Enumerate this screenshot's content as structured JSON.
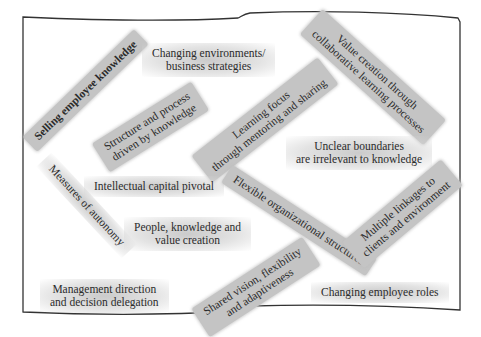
{
  "diagram": {
    "type": "concept-collage",
    "frame": "waving-flag-outline",
    "concepts": [
      {
        "id": "selling-knowledge",
        "text": "Selling employee knowledge",
        "lines": [
          "Selling employee knowledge"
        ],
        "style": "ribbon"
      },
      {
        "id": "changing-env",
        "text": "Changing environments/ business strategies",
        "lines": [
          "Changing environments/",
          "business strategies"
        ],
        "style": "soft"
      },
      {
        "id": "value-creation",
        "text": "Value creation through collaborative learning processes",
        "lines": [
          "Value creation through",
          "collaborative learning processes"
        ],
        "style": "ribbon"
      },
      {
        "id": "structure-process",
        "text": "Structure and process driven by knowledge",
        "lines": [
          "Structure and process",
          "driven by knowledge"
        ],
        "style": "ribbon"
      },
      {
        "id": "learning-focus",
        "text": "Learning focus through mentoring and sharing",
        "lines": [
          "Learning focus",
          "through mentoring and sharing"
        ],
        "style": "ribbon"
      },
      {
        "id": "unclear-boundaries",
        "text": "Unclear boundaries are irrelevant to knowledge",
        "lines": [
          "Unclear boundaries",
          "are irrelevant to knowledge"
        ],
        "style": "soft"
      },
      {
        "id": "intellectual-capital",
        "text": "Intellectual capital pivotal",
        "lines": [
          "Intellectual capital pivotal"
        ],
        "style": "soft"
      },
      {
        "id": "measures-autonomy",
        "text": "Measures of autonomy",
        "lines": [
          "Measures of autonomy"
        ],
        "style": "soft"
      },
      {
        "id": "flexible-structures",
        "text": "Flexible organizational structures",
        "lines": [
          "Flexible organizational structures"
        ],
        "style": "ribbon"
      },
      {
        "id": "multiple-linkages",
        "text": "Multiple linkages to clients and environment",
        "lines": [
          "Multiple linkages to",
          "clients and environment"
        ],
        "style": "ribbon"
      },
      {
        "id": "people-knowledge",
        "text": "People, knowledge and value creation",
        "lines": [
          "People, knowledge and",
          "value creation"
        ],
        "style": "soft"
      },
      {
        "id": "management-direction",
        "text": "Management direction and decision delegation",
        "lines": [
          "Management direction",
          "and decision delegation"
        ],
        "style": "soft"
      },
      {
        "id": "shared-vision",
        "text": "Shared vision, flexibility and adaptiveness",
        "lines": [
          "Shared vision, flexibility",
          "and adaptiveness"
        ],
        "style": "ribbon"
      },
      {
        "id": "changing-roles",
        "text": "Changing employee roles",
        "lines": [
          "Changing employee roles"
        ],
        "style": "soft"
      }
    ]
  },
  "colors": {
    "ribbon": "#c4c4c4",
    "text": "#2b2b2b",
    "frame": "#333333",
    "background": "#ffffff"
  }
}
